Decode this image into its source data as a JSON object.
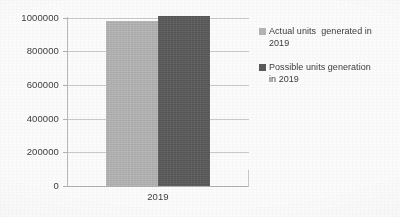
{
  "chart_data": {
    "type": "bar",
    "title": "",
    "subtitle": "",
    "xlabel": "",
    "ylabel": "",
    "categories": [
      "2019"
    ],
    "series": [
      {
        "name": "Actual units  generated in 2019",
        "values": [
          982000
        ],
        "color": "#b4b4b4"
      },
      {
        "name": "Possible units generation in 2019",
        "values": [
          1012000
        ],
        "color": "#595959"
      }
    ],
    "ylim": [
      0,
      1000000
    ],
    "y_ticks": [
      0,
      200000,
      400000,
      600000,
      800000,
      1000000
    ],
    "y_tick_labels": [
      "0",
      "200000",
      "400000",
      "600000",
      "800000",
      "1000000"
    ],
    "x_tick_labels": [
      "2019"
    ],
    "grid": "horizontal",
    "legend_position": "right"
  },
  "legend": {
    "items": [
      {
        "label": "Actual units  generated in\n2019",
        "color": "#b4b4b4"
      },
      {
        "label": "Possible units generation\nin 2019",
        "color": "#595959"
      }
    ]
  },
  "axis": {
    "y_labels": [
      "1000000",
      "800000",
      "600000",
      "400000",
      "200000",
      "0"
    ],
    "x_labels": [
      "2019"
    ]
  }
}
